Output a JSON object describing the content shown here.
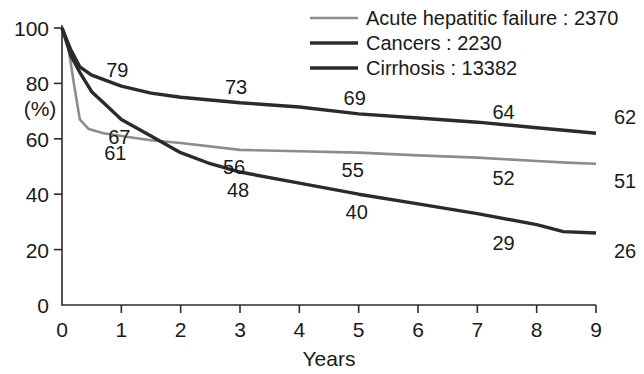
{
  "chart_data": {
    "type": "line",
    "title": "",
    "xlabel": "Years",
    "ylabel": "(%)",
    "xlim": [
      0,
      9
    ],
    "ylim": [
      0,
      100
    ],
    "xticks": [
      "0",
      "1",
      "2",
      "3",
      "4",
      "5",
      "6",
      "7",
      "8",
      "9"
    ],
    "yticks": [
      "0",
      "20",
      "40",
      "60",
      "80",
      "100"
    ],
    "grid": false,
    "legend_position": "top-right",
    "series": [
      {
        "name": "Acute hepatitic failure",
        "count": "2370",
        "legend_label": "Acute hepatitic failure : 2370",
        "color": "#8c8c8c",
        "stroke_width": 2.6,
        "x": [
          0,
          0.1,
          0.2,
          0.3,
          0.45,
          0.7,
          1,
          1.5,
          2,
          3,
          4,
          5,
          6,
          7,
          8,
          8.5,
          9
        ],
        "y": [
          100,
          94,
          80,
          67,
          63.5,
          62,
          61,
          59.5,
          58.5,
          56,
          55.5,
          55,
          54,
          53.2,
          52,
          51.4,
          51
        ],
        "labels": [
          {
            "text": "61",
            "x": 1.0,
            "y": 61
          },
          {
            "text": "56",
            "x": 3.0,
            "y": 56
          },
          {
            "text": "55",
            "x": 5.0,
            "y": 55
          },
          {
            "text": "52",
            "x": 8.0,
            "y": 52
          },
          {
            "text": "51",
            "x": 9.0,
            "y": 51
          }
        ]
      },
      {
        "name": "Cancers",
        "count": "2230",
        "legend_label": "Cancers : 2230",
        "color": "#2b2b2b",
        "stroke_width": 3.4,
        "x": [
          0,
          0.15,
          0.3,
          0.5,
          0.75,
          1,
          1.5,
          2,
          2.5,
          3,
          4,
          5,
          6,
          7,
          8,
          8.6,
          9
        ],
        "y": [
          100,
          92,
          86,
          83,
          81,
          79,
          76.5,
          75,
          74,
          73,
          71.5,
          69,
          67.5,
          66,
          64,
          62.8,
          62
        ],
        "labels": [
          {
            "text": "79",
            "x": 1.0,
            "y": 79
          },
          {
            "text": "73",
            "x": 3.0,
            "y": 73
          },
          {
            "text": "69",
            "x": 5.0,
            "y": 69
          },
          {
            "text": "64",
            "x": 8.0,
            "y": 64
          },
          {
            "text": "62",
            "x": 9.0,
            "y": 62
          }
        ]
      },
      {
        "name": "Cirrhosis",
        "count": "13382",
        "legend_label": "Cirrhosis : 13382",
        "color": "#2b2b2b",
        "stroke_width": 3.4,
        "x": [
          0,
          0.15,
          0.3,
          0.5,
          0.75,
          1,
          1.5,
          2,
          2.5,
          3,
          4,
          5,
          6,
          7,
          8,
          8.45,
          9
        ],
        "y": [
          100,
          90,
          84,
          77,
          72,
          67,
          61,
          55,
          51,
          48,
          44,
          40,
          36.5,
          33,
          29,
          26.5,
          26
        ],
        "labels": [
          {
            "text": "67",
            "x": 1.0,
            "y": 67
          },
          {
            "text": "48",
            "x": 3.0,
            "y": 48
          },
          {
            "text": "40",
            "x": 5.0,
            "y": 40
          },
          {
            "text": "29",
            "x": 8.0,
            "y": 29
          },
          {
            "text": "26",
            "x": 9.0,
            "y": 26
          }
        ]
      }
    ]
  },
  "axes": {
    "y_axis_label": "(%)",
    "x_axis_label": "Years"
  }
}
